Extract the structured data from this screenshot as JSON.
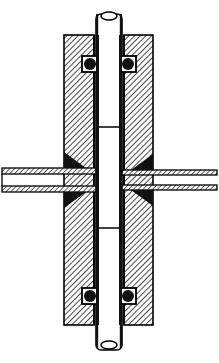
{
  "document": {
    "title": "Mechanical Assembly Cross-Section",
    "drawing_type": "engineering-section-view",
    "width": 219,
    "height": 363,
    "background_color": "#ffffff",
    "line_color": "#000000",
    "hatch_color": "#1a1a1a",
    "seal_color": "#111111",
    "fill_color": "#ffffff"
  },
  "geometry": {
    "housing": {
      "name": "housing-block",
      "left": 64,
      "top": 35,
      "right": 153,
      "bottom": 325,
      "bore_left": 94,
      "bore_right": 124,
      "hatch_angle_deg": 45,
      "hatch_spacing": 4,
      "outline_width": 1.6
    },
    "shaft": {
      "name": "vertical-shaft",
      "left": 96,
      "right": 122,
      "top": 14,
      "bottom": 350,
      "wall_width": 3,
      "corner_radius": 5,
      "segment_lines_y": [
        127,
        228
      ],
      "tip_detail_radius": 5
    },
    "shaft_tip_top": {
      "name": "shaft-top-tip",
      "center_x": 109,
      "center_y": 16,
      "rx": 8,
      "ry": 4
    },
    "shaft_tip_bottom": {
      "name": "shaft-bottom-tip",
      "center_x": 109,
      "center_y": 347,
      "rx": 8,
      "ry": 4
    },
    "seals": [
      {
        "name": "seal-top-left",
        "cx": 90,
        "cy": 64,
        "r": 6,
        "groove_w": 16,
        "groove_h": 16
      },
      {
        "name": "seal-top-right",
        "cx": 128,
        "cy": 64,
        "r": 6,
        "groove_w": 16,
        "groove_h": 16
      },
      {
        "name": "seal-bottom-left",
        "cx": 90,
        "cy": 296,
        "r": 6,
        "groove_w": 16,
        "groove_h": 16
      },
      {
        "name": "seal-bottom-right",
        "cx": 128,
        "cy": 296,
        "r": 6,
        "groove_w": 16,
        "groove_h": 16
      }
    ],
    "port_left": {
      "name": "port-tube-left",
      "x_start": 2,
      "x_end": 98,
      "top": 168,
      "bottom": 192,
      "wall_thickness": 6,
      "bore_top": 174,
      "bore_bottom": 186
    },
    "port_right": {
      "name": "port-tube-right",
      "x_start": 121,
      "x_end": 217,
      "top": 170,
      "bottom": 190,
      "wall_thickness": 5,
      "bore_top": 175,
      "bore_bottom": 185
    },
    "fillets": [
      {
        "name": "fillet-left-upper",
        "x": 64,
        "y": 168,
        "w": 22,
        "h": 18,
        "orientation": "upper-left"
      },
      {
        "name": "fillet-left-lower",
        "x": 64,
        "y": 192,
        "w": 22,
        "h": 18,
        "orientation": "lower-left"
      },
      {
        "name": "fillet-right-upper",
        "x": 131,
        "y": 170,
        "w": 22,
        "h": 18,
        "orientation": "upper-right"
      },
      {
        "name": "fillet-right-lower",
        "x": 131,
        "y": 190,
        "w": 22,
        "h": 18,
        "orientation": "lower-right"
      }
    ],
    "arrow_marker": {
      "name": "flow-arrow-marker",
      "x": 112,
      "y": 180,
      "length": 10
    },
    "center_gap": {
      "name": "bore-center-gap",
      "left": 96,
      "right": 122
    }
  },
  "labels": {
    "none_visible": ""
  }
}
